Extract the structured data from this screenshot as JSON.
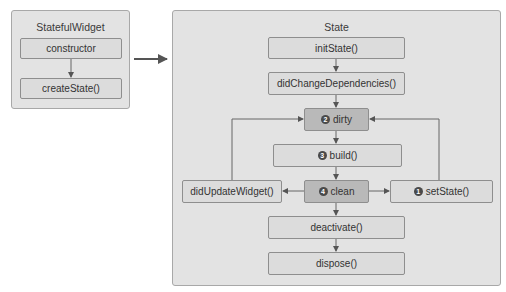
{
  "stateful_widget": {
    "title": "StatefulWidget",
    "nodes": [
      {
        "label": "constructor"
      },
      {
        "label": "createState()"
      }
    ]
  },
  "state": {
    "title": "State",
    "nodes": {
      "init_state": {
        "label": "initState()"
      },
      "did_change_dependencies": {
        "label": "didChangeDependencies()"
      },
      "dirty": {
        "badge": "2",
        "label": "dirty"
      },
      "build": {
        "badge": "3",
        "label": "build()"
      },
      "clean": {
        "badge": "4",
        "label": "clean"
      },
      "did_update_widget": {
        "label": "didUpdateWidget()"
      },
      "set_state": {
        "badge": "1",
        "label": "setState()"
      },
      "deactivate": {
        "label": "deactivate()"
      },
      "dispose": {
        "label": "dispose()"
      }
    }
  },
  "edges": [
    [
      "constructor",
      "createState()"
    ],
    [
      "StatefulWidget",
      "State"
    ],
    [
      "initState()",
      "didChangeDependencies()"
    ],
    [
      "didChangeDependencies()",
      "dirty"
    ],
    [
      "dirty",
      "build()"
    ],
    [
      "build()",
      "clean"
    ],
    [
      "clean",
      "didUpdateWidget()"
    ],
    [
      "clean",
      "setState()"
    ],
    [
      "didUpdateWidget()",
      "dirty"
    ],
    [
      "setState()",
      "dirty"
    ],
    [
      "clean",
      "deactivate()"
    ],
    [
      "deactivate()",
      "dispose()"
    ]
  ]
}
